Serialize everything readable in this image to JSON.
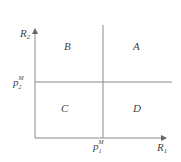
{
  "diagram": {
    "type": "quadrant",
    "axes": {
      "x_label": "R",
      "x_sub": "1",
      "y_label": "R",
      "y_sub": "2"
    },
    "thresholds": {
      "x_marker": {
        "base": "p",
        "sup": "M",
        "sub": "1"
      },
      "y_marker": {
        "base": "p",
        "sup": "M",
        "sub": "2"
      }
    },
    "regions": {
      "top_left": "B",
      "top_right": "A",
      "bottom_left": "C",
      "bottom_right": "D"
    },
    "colors": {
      "line": "#8a8a8a",
      "text": "#444444",
      "background": "#ffffff"
    }
  }
}
